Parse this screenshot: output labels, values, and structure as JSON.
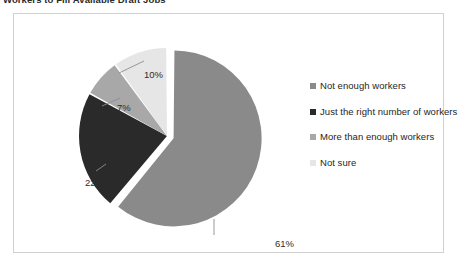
{
  "chart_title": "Workers to Fill Available Draft Jobs",
  "panel": {
    "background": "#ffffff",
    "border_color": "#d2d2d2"
  },
  "chart_data": {
    "type": "pie",
    "title": "Workers to Fill Available Draft Jobs",
    "xlabel": "",
    "ylabel": "",
    "legend_position": "right",
    "grid": false,
    "exploded_slice_index": 0,
    "categories": [
      "Not enough workers",
      "Just the right number of workers",
      "More than enough workers",
      "Not sure"
    ],
    "values": [
      61,
      22,
      7,
      10
    ],
    "value_labels": [
      "61%",
      "22%",
      "7%",
      "10%"
    ],
    "colors": [
      "#8a8a8a",
      "#2a2a2a",
      "#a8a8a8",
      "#e6e6e6"
    ],
    "total": 100,
    "units": "percent"
  },
  "legend": {
    "items": [
      {
        "label": "Not enough workers",
        "color": "#8a8a8a"
      },
      {
        "label": "Just the right number of workers",
        "color": "#2a2a2a"
      },
      {
        "label": "More than enough workers",
        "color": "#a8a8a8"
      },
      {
        "label": "Not sure",
        "color": "#e6e6e6"
      }
    ]
  },
  "labels": {
    "pct_61": "61%",
    "pct_22": "22%",
    "pct_7": "7%",
    "pct_10": "10%"
  }
}
